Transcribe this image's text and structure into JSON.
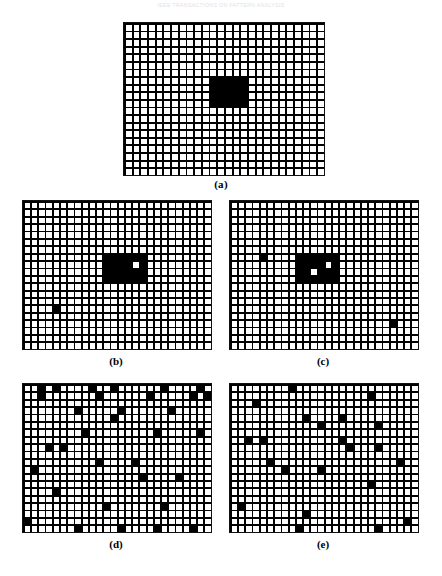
{
  "figure": {
    "scan_header": "IEEE TRANSACTIONS ON PATTERN ANALYSIS",
    "caption_a": "(a)",
    "caption_b": "(b)",
    "caption_c": "(c)",
    "caption_d": "(d)",
    "caption_e": "(e)"
  },
  "colors": {
    "ink": "#000000",
    "paper": "#ffffff",
    "grid_line": "#111111",
    "header_gray": "#c9c9cf"
  },
  "chart_data": {
    "type": "heatmap",
    "grid": {
      "cols": 26,
      "rows": 20,
      "cell_px": 7.4,
      "line_px": 1.6
    },
    "panels": [
      {
        "id": "a",
        "label": "(a)",
        "cols": 26,
        "rows": 20,
        "blobs": [
          {
            "col": 11,
            "row": 7,
            "w": 5,
            "h": 4
          }
        ],
        "black_cells": [],
        "holes": []
      },
      {
        "id": "b",
        "label": "(b)",
        "cols": 26,
        "rows": 20,
        "blobs": [
          {
            "col": 11,
            "row": 7,
            "w": 6,
            "h": 4
          }
        ],
        "black_cells": [
          {
            "col": 4,
            "row": 14
          }
        ],
        "holes": [
          {
            "col": 15,
            "row": 8
          }
        ]
      },
      {
        "id": "c",
        "label": "(c)",
        "cols": 26,
        "rows": 20,
        "blobs": [
          {
            "col": 9,
            "row": 7,
            "w": 6,
            "h": 4
          }
        ],
        "black_cells": [
          {
            "col": 4,
            "row": 7
          },
          {
            "col": 22,
            "row": 16
          }
        ],
        "holes": [
          {
            "col": 11,
            "row": 9
          },
          {
            "col": 13,
            "row": 8
          }
        ]
      },
      {
        "id": "d",
        "label": "(d)",
        "cols": 26,
        "rows": 20,
        "blobs": [],
        "holes": [],
        "black_cells": [
          {
            "col": 2,
            "row": 0
          },
          {
            "col": 4,
            "row": 0
          },
          {
            "col": 9,
            "row": 0
          },
          {
            "col": 12,
            "row": 0
          },
          {
            "col": 19,
            "row": 0
          },
          {
            "col": 24,
            "row": 0
          },
          {
            "col": 2,
            "row": 1
          },
          {
            "col": 10,
            "row": 1
          },
          {
            "col": 17,
            "row": 1
          },
          {
            "col": 23,
            "row": 1
          },
          {
            "col": 25,
            "row": 1
          },
          {
            "col": 7,
            "row": 3
          },
          {
            "col": 13,
            "row": 3
          },
          {
            "col": 20,
            "row": 3
          },
          {
            "col": 12,
            "row": 4
          },
          {
            "col": 8,
            "row": 6
          },
          {
            "col": 18,
            "row": 6
          },
          {
            "col": 24,
            "row": 6
          },
          {
            "col": 3,
            "row": 8
          },
          {
            "col": 5,
            "row": 8
          },
          {
            "col": 10,
            "row": 10
          },
          {
            "col": 15,
            "row": 10
          },
          {
            "col": 1,
            "row": 11
          },
          {
            "col": 16,
            "row": 12
          },
          {
            "col": 21,
            "row": 12
          },
          {
            "col": 4,
            "row": 14
          },
          {
            "col": 11,
            "row": 16
          },
          {
            "col": 19,
            "row": 16
          },
          {
            "col": 0,
            "row": 18
          },
          {
            "col": 7,
            "row": 19
          },
          {
            "col": 13,
            "row": 19
          },
          {
            "col": 18,
            "row": 19
          },
          {
            "col": 23,
            "row": 19
          }
        ]
      },
      {
        "id": "e",
        "label": "(e)",
        "cols": 26,
        "rows": 20,
        "blobs": [],
        "holes": [],
        "black_cells": [
          {
            "col": 8,
            "row": 0
          },
          {
            "col": 19,
            "row": 1
          },
          {
            "col": 3,
            "row": 2
          },
          {
            "col": 10,
            "row": 4
          },
          {
            "col": 15,
            "row": 4
          },
          {
            "col": 12,
            "row": 5
          },
          {
            "col": 20,
            "row": 5
          },
          {
            "col": 2,
            "row": 7
          },
          {
            "col": 4,
            "row": 7
          },
          {
            "col": 15,
            "row": 7
          },
          {
            "col": 16,
            "row": 8
          },
          {
            "col": 20,
            "row": 8
          },
          {
            "col": 5,
            "row": 10
          },
          {
            "col": 23,
            "row": 10
          },
          {
            "col": 7,
            "row": 11
          },
          {
            "col": 12,
            "row": 11
          },
          {
            "col": 19,
            "row": 13
          },
          {
            "col": 1,
            "row": 16
          },
          {
            "col": 10,
            "row": 17
          },
          {
            "col": 9,
            "row": 19
          },
          {
            "col": 20,
            "row": 19
          },
          {
            "col": 24,
            "row": 18
          }
        ]
      }
    ]
  },
  "layout": {
    "panel_a": {
      "x": 123,
      "y": 22,
      "w": 200,
      "h": 152
    },
    "panel_b": {
      "x": 22,
      "y": 200,
      "w": 188,
      "h": 148
    },
    "panel_c": {
      "x": 229,
      "y": 200,
      "w": 188,
      "h": 148
    },
    "panel_d": {
      "x": 22,
      "y": 383,
      "w": 188,
      "h": 148
    },
    "panel_e": {
      "x": 229,
      "y": 383,
      "w": 188,
      "h": 148
    },
    "cap_a": {
      "x": 0,
      "y": 178
    },
    "cap_b": {
      "x": 22,
      "y": 355
    },
    "cap_c": {
      "x": 229,
      "y": 355
    },
    "cap_d": {
      "x": 22,
      "y": 538
    },
    "cap_e": {
      "x": 229,
      "y": 538
    }
  }
}
